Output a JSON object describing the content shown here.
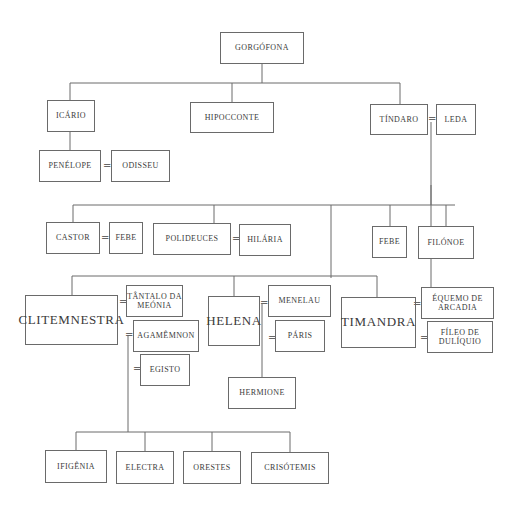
{
  "diagram": {
    "people": {
      "gorgofona": "GORGÓFONA",
      "icario": "ICÁRIO",
      "hipocconte": "HIPOCCONTE",
      "tindaro": "TÍNDARO",
      "leda": "LEDA",
      "penelope": "PENÉLOPE",
      "odisseu": "ODISSEU",
      "castor": "CASTOR",
      "febe1": "FEBE",
      "polideuces": "POLIDEUCES",
      "hilaria": "HILÁRIA",
      "febe2": "FEBE",
      "filonoe": "FILÓNOE",
      "clitemnestra": "CLITEMNESTRA",
      "tantalo": "TÂNTALO DA MEÓNIA",
      "agamemnon": "AGAMÊMNON",
      "egisto": "EGISTO",
      "helena": "HELENA",
      "menelau": "MENELAU",
      "paris": "PÁRIS",
      "hermione": "HERMIONE",
      "timandra": "TIMANDRA",
      "equemo": "ÉQUEMO DE ARCADIA",
      "fileo": "FÍLEO DE DULÍQUIO",
      "ifigenia": "IFIGÊNIA",
      "electra": "ELECTRA",
      "orestes": "ORESTES",
      "crisotemis": "CRISÓTEMIS"
    },
    "marriage_symbol": "=",
    "marriages": [
      [
        "tindaro",
        "leda"
      ],
      [
        "penelope",
        "odisseu"
      ],
      [
        "castor",
        "febe1"
      ],
      [
        "polideuces",
        "hilaria"
      ],
      [
        "clitemnestra",
        "tantalo"
      ],
      [
        "clitemnestra",
        "agamemnon"
      ],
      [
        "clitemnestra",
        "egisto"
      ],
      [
        "helena",
        "menelau"
      ],
      [
        "helena",
        "paris"
      ],
      [
        "timandra",
        "equemo"
      ],
      [
        "timandra",
        "fileo"
      ]
    ],
    "line_color": "#6a6a6a"
  }
}
